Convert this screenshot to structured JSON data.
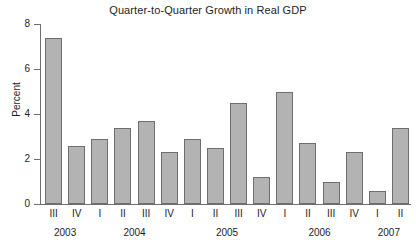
{
  "chart_data": {
    "type": "bar",
    "title": "Quarter-to-Quarter Growth in Real GDP",
    "xlabel": "",
    "ylabel": "Percent",
    "ylim": [
      0,
      8
    ],
    "yticks": [
      0,
      2,
      4,
      6,
      8
    ],
    "grid": false,
    "legend": null,
    "categories": [
      "III",
      "IV",
      "I",
      "II",
      "III",
      "IV",
      "I",
      "II",
      "III",
      "IV",
      "I",
      "II",
      "III",
      "IV",
      "I",
      "II"
    ],
    "values": [
      7.4,
      2.6,
      2.9,
      3.4,
      3.7,
      2.3,
      2.9,
      2.5,
      4.5,
      1.2,
      5.0,
      2.7,
      1.0,
      2.3,
      0.6,
      3.4
    ],
    "year_groups": [
      {
        "label": "2003",
        "start_index": 0,
        "span": 2
      },
      {
        "label": "2004",
        "start_index": 2,
        "span": 4
      },
      {
        "label": "2005",
        "start_index": 6,
        "span": 4
      },
      {
        "label": "2006",
        "start_index": 10,
        "span": 4
      },
      {
        "label": "2007",
        "start_index": 14,
        "span": 2
      }
    ],
    "colors": {
      "bar_fill": "#b3b3b3",
      "bar_border": "#6e6e6e",
      "axis": "#6f6f6f",
      "text": "#1d1d1d",
      "background": "#ffffff"
    }
  }
}
